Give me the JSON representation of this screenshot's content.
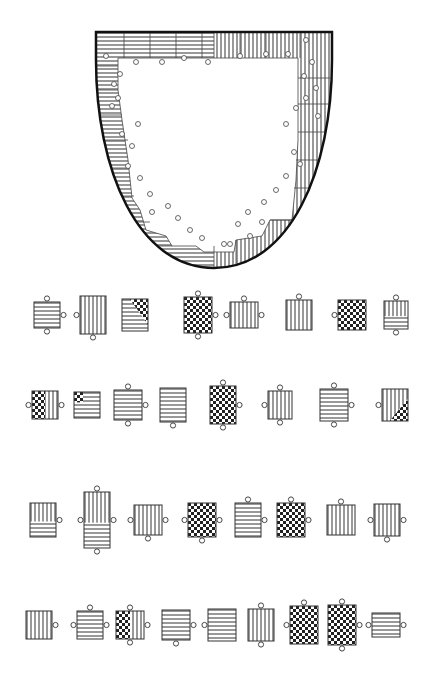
{
  "diagram": {
    "type": "jigsaw-puzzle",
    "board": {
      "shape": "shield",
      "top_y": 32,
      "left_x": 96,
      "right_x": 332,
      "bottom_x": 214,
      "bottom_y": 268,
      "hole": {
        "top": 58,
        "left": 116,
        "right": 298,
        "bottom": 250
      },
      "left_fill": "horizontal-stripes",
      "right_fill": "vertical-stripes"
    },
    "colors": {
      "line": "#222222",
      "background": "#ffffff",
      "stripe": "#333333"
    },
    "pieces_rows": [
      {
        "y": 315,
        "pieces": [
          {
            "x": 34,
            "w": 26,
            "h": 26,
            "fill": "h",
            "tabs": "t,r,b"
          },
          {
            "x": 80,
            "w": 26,
            "h": 38,
            "fill": "v",
            "tabs": "l,b"
          },
          {
            "x": 122,
            "w": 26,
            "h": 32,
            "fill": "hv-check",
            "tabs": ""
          },
          {
            "x": 184,
            "w": 28,
            "h": 36,
            "fill": "check",
            "tabs": "t,r,b"
          },
          {
            "x": 230,
            "w": 28,
            "h": 26,
            "fill": "v",
            "tabs": "t,l,r"
          },
          {
            "x": 286,
            "w": 26,
            "h": 30,
            "fill": "v",
            "tabs": "t"
          },
          {
            "x": 338,
            "w": 28,
            "h": 30,
            "fill": "check",
            "tabs": "l"
          },
          {
            "x": 384,
            "w": 24,
            "h": 28,
            "fill": "vh",
            "tabs": "t,b"
          }
        ]
      },
      {
        "y": 405,
        "pieces": [
          {
            "x": 32,
            "w": 26,
            "h": 28,
            "fill": "check-v",
            "tabs": "l,r"
          },
          {
            "x": 74,
            "w": 26,
            "h": 26,
            "fill": "check-h",
            "tabs": ""
          },
          {
            "x": 114,
            "w": 28,
            "h": 30,
            "fill": "h",
            "tabs": "t,r,b"
          },
          {
            "x": 160,
            "w": 26,
            "h": 34,
            "fill": "h",
            "tabs": "b"
          },
          {
            "x": 210,
            "w": 26,
            "h": 38,
            "fill": "check",
            "tabs": "t,r,b"
          },
          {
            "x": 268,
            "w": 24,
            "h": 28,
            "fill": "v",
            "tabs": "t,l,b"
          },
          {
            "x": 320,
            "w": 28,
            "h": 32,
            "fill": "h",
            "tabs": "t,r,b"
          },
          {
            "x": 382,
            "w": 26,
            "h": 32,
            "fill": "v-check",
            "tabs": "l"
          }
        ]
      },
      {
        "y": 520,
        "pieces": [
          {
            "x": 30,
            "w": 26,
            "h": 34,
            "fill": "vh",
            "tabs": "r"
          },
          {
            "x": 84,
            "w": 26,
            "h": 56,
            "fill": "vh-tall",
            "tabs": "t,l,r,b"
          },
          {
            "x": 134,
            "w": 28,
            "h": 30,
            "fill": "v",
            "tabs": "l,r,b"
          },
          {
            "x": 188,
            "w": 28,
            "h": 34,
            "fill": "check",
            "tabs": "l,r,b"
          },
          {
            "x": 235,
            "w": 26,
            "h": 34,
            "fill": "h",
            "tabs": "t,r"
          },
          {
            "x": 277,
            "w": 28,
            "h": 34,
            "fill": "check",
            "tabs": "t,r"
          },
          {
            "x": 327,
            "w": 28,
            "h": 30,
            "fill": "v",
            "tabs": "t"
          },
          {
            "x": 374,
            "w": 26,
            "h": 32,
            "fill": "v",
            "tabs": "l,r,b"
          }
        ]
      },
      {
        "y": 625,
        "pieces": [
          {
            "x": 26,
            "w": 26,
            "h": 28,
            "fill": "v",
            "tabs": "r"
          },
          {
            "x": 77,
            "w": 26,
            "h": 28,
            "fill": "h",
            "tabs": "t,l,r"
          },
          {
            "x": 116,
            "w": 28,
            "h": 28,
            "fill": "check-v",
            "tabs": "t,r,b"
          },
          {
            "x": 162,
            "w": 28,
            "h": 30,
            "fill": "h",
            "tabs": "r,b"
          },
          {
            "x": 208,
            "w": 28,
            "h": 32,
            "fill": "h",
            "tabs": "l"
          },
          {
            "x": 248,
            "w": 26,
            "h": 32,
            "fill": "v",
            "tabs": "t,b"
          },
          {
            "x": 290,
            "w": 28,
            "h": 38,
            "fill": "check",
            "tabs": "t,l"
          },
          {
            "x": 328,
            "w": 28,
            "h": 40,
            "fill": "check",
            "tabs": "t,r,b"
          },
          {
            "x": 372,
            "w": 28,
            "h": 24,
            "fill": "h",
            "tabs": "l,r"
          }
        ]
      }
    ]
  }
}
